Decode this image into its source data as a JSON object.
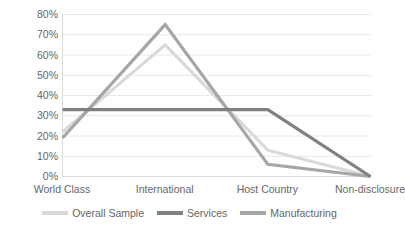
{
  "chart_data": {
    "type": "line",
    "title": "",
    "subtitle": "",
    "xlabel": "",
    "ylabel": "",
    "categories": [
      "World Class",
      "International",
      "Host Country",
      "Non-disclosure"
    ],
    "series": [
      {
        "name": "Overall Sample",
        "values": [
          22,
          65,
          13,
          0
        ],
        "color": "#D9D9D9"
      },
      {
        "name": "Services",
        "values": [
          33,
          33,
          33,
          0
        ],
        "color": "#808080"
      },
      {
        "name": "Manufacturing",
        "values": [
          19,
          75,
          6,
          0
        ],
        "color": "#A6A6A6"
      }
    ],
    "ylim": [
      0,
      80
    ],
    "ytick_values": [
      0,
      10,
      20,
      30,
      40,
      50,
      60,
      70,
      80
    ],
    "ytick_labels": [
      "0%",
      "10%",
      "20%",
      "30%",
      "40%",
      "50%",
      "60%",
      "70%",
      "80%"
    ],
    "ytick_suffix": "%",
    "grid": true,
    "grid_axis": "y",
    "grid_color": "#E8E8E8",
    "axis_color": "#D9D9D9",
    "legend_position": "bottom",
    "legend_entries": [
      "Overall Sample",
      "Services",
      "Manufacturing"
    ],
    "annotations": [],
    "background_color": "#FFFFFF",
    "text_color": "#666666"
  }
}
